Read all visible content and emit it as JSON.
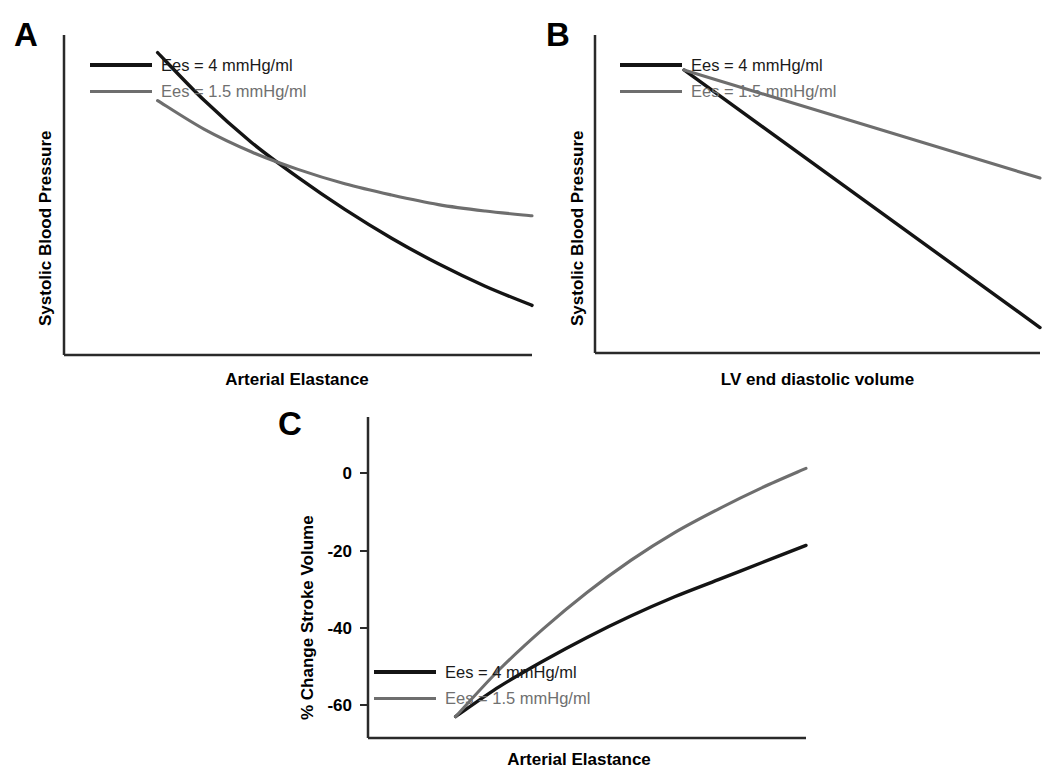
{
  "figure": {
    "type": "multi-panel-line-chart",
    "background": "#ffffff",
    "series_colors": {
      "black": "#141414",
      "gray": "#6e6e6e"
    }
  },
  "legend": {
    "black_label": "Ees = 4 mmHg/ml",
    "gray_label": "Ees = 1.5 mmHg/ml"
  },
  "panels": {
    "a": {
      "letter": "A",
      "xlabel": "Arterial Elastance",
      "ylabel": "Systolic Blood Pressure"
    },
    "b": {
      "letter": "B",
      "xlabel": "LV end diastolic volume",
      "ylabel": "Systolic Blood Pressure"
    },
    "c": {
      "letter": "C",
      "xlabel": "Arterial Elastance",
      "ylabel": "% Change Stroke Volume",
      "yticks": [
        "0",
        "-20",
        "-40",
        "-60"
      ]
    }
  },
  "chart_data": [
    {
      "id": "panel-a",
      "type": "line",
      "title": "A",
      "xlabel": "Arterial Elastance",
      "ylabel": "Systolic Blood Pressure",
      "xlim": [
        0,
        10
      ],
      "ylim": [
        0,
        10
      ],
      "axis_ticks": false,
      "grid": false,
      "legend_position": "top-left",
      "x": [
        2.0,
        3.0,
        4.0,
        5.0,
        6.0,
        7.0,
        8.0,
        9.0,
        10.0
      ],
      "series": [
        {
          "name": "Ees = 4 mmHg/ml",
          "color": "#141414",
          "values": [
            0.55,
            2.05,
            3.35,
            4.45,
            5.45,
            6.35,
            7.15,
            7.85,
            8.45
          ]
        },
        {
          "name": "Ees = 1.5 mmHg/ml",
          "color": "#6e6e6e",
          "values": [
            2.05,
            2.95,
            3.65,
            4.2,
            4.65,
            5.0,
            5.3,
            5.5,
            5.65
          ]
        }
      ],
      "annotations": [
        "curves cross at about x = 4.4"
      ]
    },
    {
      "id": "panel-b",
      "type": "line",
      "title": "B",
      "xlabel": "LV end diastolic volume",
      "ylabel": "Systolic Blood Pressure",
      "xlim": [
        0,
        10
      ],
      "ylim": [
        0,
        10
      ],
      "axis_ticks": false,
      "grid": false,
      "legend_position": "top-left",
      "x": [
        2.0,
        10.0
      ],
      "series": [
        {
          "name": "Ees = 4 mmHg/ml",
          "color": "#141414",
          "values": [
            1.1,
            9.2
          ]
        },
        {
          "name": "Ees = 1.5 mmHg/ml",
          "color": "#6e6e6e",
          "values": [
            1.1,
            4.5
          ]
        }
      ],
      "annotations": [
        "both lines originate from a common point; black slope is steeper"
      ]
    },
    {
      "id": "panel-c",
      "type": "line",
      "title": "C",
      "xlabel": "Arterial Elastance",
      "ylabel": "% Change Stroke Volume",
      "xlim": [
        0,
        10
      ],
      "ylim": [
        -70,
        5
      ],
      "yticks": [
        0,
        -20,
        -40,
        -60
      ],
      "ytick_labels": [
        "0",
        "-20",
        "-40",
        "-60"
      ],
      "grid": false,
      "legend_position": "bottom-left",
      "x": [
        2.0,
        3.0,
        4.0,
        5.0,
        6.0,
        7.0,
        8.0,
        9.0,
        10.0
      ],
      "series": [
        {
          "name": "Ees = 4 mmHg/ml",
          "color": "#141414",
          "values": [
            0,
            -7,
            -13,
            -18.5,
            -23.5,
            -28,
            -32,
            -36,
            -40
          ]
        },
        {
          "name": "Ees = 1.5 mmHg/ml",
          "color": "#6e6e6e",
          "values": [
            0,
            -11,
            -20.5,
            -29,
            -36.5,
            -43,
            -48.5,
            -53.5,
            -58
          ]
        }
      ],
      "annotations": [
        "both curves start at 0% and decline; gray declines faster"
      ]
    }
  ]
}
